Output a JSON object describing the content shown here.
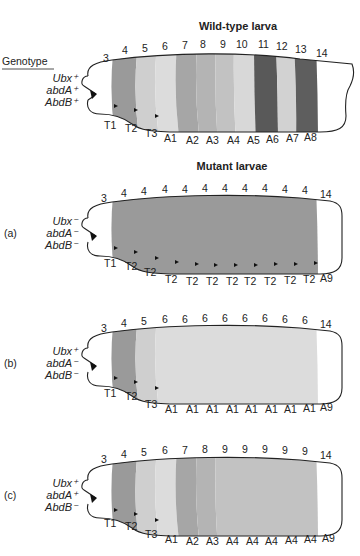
{
  "wildtype": {
    "title": "Wild-type larva",
    "genotype_header": "Genotype",
    "genotype": [
      "Ubx⁺",
      "abdA⁺",
      "AbdB⁺"
    ],
    "parasegments": [
      "3",
      "4",
      "5",
      "6",
      "7",
      "8",
      "9",
      "10",
      "11",
      "12",
      "13",
      "14"
    ],
    "segments": [
      "T1",
      "T2",
      "T3",
      "A1",
      "A2",
      "A3",
      "A4",
      "A5",
      "A6",
      "A7",
      "A8"
    ],
    "band_colors": [
      "#9a9a9a",
      "#cfcfcf",
      "#dcdcdc",
      "#a6a6a6",
      "#b4b4b4",
      "#c2c2c2",
      "#d8d8d8",
      "#595959",
      "#d2d2d2",
      "#5e5e5e"
    ]
  },
  "mutant_title": "Mutant larvae",
  "mutants": [
    {
      "label": "(a)",
      "genotype": [
        "Ubx⁻",
        "abdA⁻",
        "AbdB⁻"
      ],
      "parasegments": [
        "3",
        "4",
        "4",
        "4",
        "4",
        "4",
        "4",
        "4",
        "4",
        "4",
        "4",
        "14"
      ],
      "segments": [
        "T1",
        "T2",
        "T2",
        "T2",
        "T2",
        "T2",
        "T2",
        "T2",
        "T2",
        "T2",
        "T2",
        "A9"
      ]
    },
    {
      "label": "(b)",
      "genotype": [
        "Ubx⁺",
        "abdA⁻",
        "AbdB⁻"
      ],
      "parasegments": [
        "3",
        "4",
        "5",
        "6",
        "6",
        "6",
        "6",
        "6",
        "6",
        "6",
        "6",
        "14"
      ],
      "segments": [
        "T1",
        "T2",
        "T3",
        "A1",
        "A1",
        "A1",
        "A1",
        "A1",
        "A1",
        "A1",
        "A1",
        "A9"
      ]
    },
    {
      "label": "(c)",
      "genotype": [
        "Ubx⁺",
        "abdA⁺",
        "AbdB⁻"
      ],
      "parasegments": [
        "3",
        "4",
        "5",
        "6",
        "7",
        "8",
        "9",
        "9",
        "9",
        "9",
        "9",
        "14"
      ],
      "segments": [
        "T1",
        "T2",
        "T3",
        "A1",
        "A2",
        "A3",
        "A4",
        "A4",
        "A4",
        "A4",
        "A4",
        "A9"
      ]
    }
  ]
}
